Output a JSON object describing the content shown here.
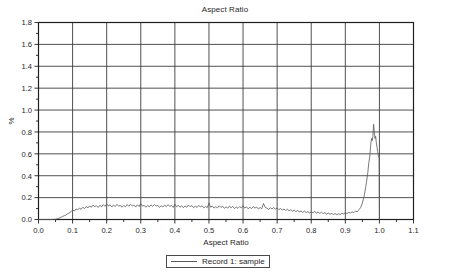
{
  "chart_data": {
    "type": "line",
    "title": "Aspect Ratio",
    "xlabel": "Aspect Ratio",
    "ylabel": "%",
    "xlim": [
      0.0,
      1.1
    ],
    "ylim": [
      0.0,
      1.8
    ],
    "grid": true,
    "legend_position": "bottom-center",
    "x_ticks": [
      "0.0",
      "0.1",
      "0.2",
      "0.3",
      "0.4",
      "0.5",
      "0.6",
      "0.7",
      "0.8",
      "0.9",
      "1.0",
      "1.1"
    ],
    "x_tick_values": [
      0.0,
      0.1,
      0.2,
      0.3,
      0.4,
      0.5,
      0.6,
      0.7,
      0.8,
      0.9,
      1.0,
      1.1
    ],
    "y_ticks": [
      "0.0",
      "0.2",
      "0.4",
      "0.6",
      "0.8",
      "1.0",
      "1.2",
      "1.4",
      "1.6",
      "1.8"
    ],
    "y_tick_values": [
      0.0,
      0.2,
      0.4,
      0.6,
      0.8,
      1.0,
      1.2,
      1.4,
      1.6,
      1.8
    ],
    "x_minor_step": 0.05,
    "y_minor_step": 0.1,
    "series": [
      {
        "name": "Record 1: sample",
        "color": "#595959",
        "x": [
          0.0,
          0.01,
          0.02,
          0.03,
          0.04,
          0.05,
          0.055,
          0.06,
          0.065,
          0.07,
          0.075,
          0.08,
          0.085,
          0.09,
          0.095,
          0.1,
          0.105,
          0.11,
          0.115,
          0.12,
          0.125,
          0.13,
          0.135,
          0.14,
          0.145,
          0.15,
          0.155,
          0.16,
          0.165,
          0.17,
          0.175,
          0.18,
          0.185,
          0.19,
          0.195,
          0.2,
          0.205,
          0.21,
          0.215,
          0.22,
          0.225,
          0.23,
          0.235,
          0.24,
          0.245,
          0.25,
          0.255,
          0.26,
          0.265,
          0.27,
          0.275,
          0.28,
          0.285,
          0.29,
          0.295,
          0.3,
          0.305,
          0.31,
          0.315,
          0.32,
          0.325,
          0.33,
          0.335,
          0.34,
          0.345,
          0.35,
          0.355,
          0.36,
          0.365,
          0.37,
          0.375,
          0.38,
          0.385,
          0.39,
          0.395,
          0.4,
          0.405,
          0.41,
          0.415,
          0.42,
          0.425,
          0.43,
          0.435,
          0.44,
          0.445,
          0.45,
          0.455,
          0.46,
          0.465,
          0.47,
          0.475,
          0.48,
          0.485,
          0.49,
          0.495,
          0.5,
          0.505,
          0.51,
          0.515,
          0.52,
          0.525,
          0.53,
          0.535,
          0.54,
          0.545,
          0.55,
          0.555,
          0.56,
          0.565,
          0.57,
          0.575,
          0.58,
          0.585,
          0.59,
          0.595,
          0.6,
          0.605,
          0.61,
          0.615,
          0.62,
          0.625,
          0.63,
          0.635,
          0.64,
          0.645,
          0.65,
          0.655,
          0.66,
          0.665,
          0.67,
          0.675,
          0.68,
          0.685,
          0.69,
          0.695,
          0.7,
          0.705,
          0.71,
          0.715,
          0.72,
          0.725,
          0.73,
          0.735,
          0.74,
          0.745,
          0.75,
          0.755,
          0.76,
          0.765,
          0.77,
          0.775,
          0.78,
          0.785,
          0.79,
          0.795,
          0.8,
          0.805,
          0.81,
          0.815,
          0.82,
          0.825,
          0.83,
          0.835,
          0.84,
          0.845,
          0.85,
          0.855,
          0.86,
          0.865,
          0.87,
          0.875,
          0.88,
          0.885,
          0.89,
          0.895,
          0.9,
          0.905,
          0.91,
          0.915,
          0.92,
          0.925,
          0.93,
          0.935,
          0.94,
          0.945,
          0.95,
          0.955,
          0.96,
          0.963,
          0.966,
          0.969,
          0.972,
          0.975,
          0.977,
          0.979,
          0.981,
          0.983,
          0.985,
          0.987,
          0.989,
          0.991,
          0.993,
          0.995,
          0.997,
          0.999,
          1.0
        ],
        "y": [
          0.0,
          0.0,
          0.0,
          0.0,
          0.0,
          0.002,
          0.006,
          0.012,
          0.018,
          0.026,
          0.034,
          0.04,
          0.052,
          0.06,
          0.07,
          0.086,
          0.078,
          0.096,
          0.088,
          0.104,
          0.094,
          0.112,
          0.1,
          0.118,
          0.106,
          0.124,
          0.112,
          0.132,
          0.118,
          0.126,
          0.11,
          0.13,
          0.116,
          0.136,
          0.12,
          0.142,
          0.124,
          0.134,
          0.114,
          0.132,
          0.118,
          0.138,
          0.122,
          0.13,
          0.112,
          0.128,
          0.116,
          0.136,
          0.12,
          0.14,
          0.124,
          0.132,
          0.114,
          0.134,
          0.118,
          0.146,
          0.122,
          0.13,
          0.112,
          0.128,
          0.116,
          0.134,
          0.12,
          0.138,
          0.122,
          0.13,
          0.11,
          0.126,
          0.114,
          0.132,
          0.118,
          0.136,
          0.12,
          0.128,
          0.11,
          0.14,
          0.116,
          0.13,
          0.112,
          0.126,
          0.108,
          0.124,
          0.112,
          0.132,
          0.116,
          0.128,
          0.108,
          0.122,
          0.11,
          0.13,
          0.114,
          0.126,
          0.106,
          0.12,
          0.108,
          0.15,
          0.112,
          0.124,
          0.104,
          0.118,
          0.106,
          0.126,
          0.11,
          0.122,
          0.102,
          0.116,
          0.104,
          0.122,
          0.108,
          0.12,
          0.1,
          0.114,
          0.102,
          0.118,
          0.106,
          0.126,
          0.104,
          0.116,
          0.098,
          0.112,
          0.1,
          0.118,
          0.104,
          0.114,
          0.096,
          0.11,
          0.098,
          0.146,
          0.112,
          0.104,
          0.092,
          0.108,
          0.096,
          0.11,
          0.094,
          0.106,
          0.09,
          0.1,
          0.086,
          0.096,
          0.082,
          0.094,
          0.08,
          0.09,
          0.076,
          0.086,
          0.072,
          0.082,
          0.07,
          0.078,
          0.066,
          0.076,
          0.064,
          0.072,
          0.06,
          0.07,
          0.062,
          0.074,
          0.06,
          0.068,
          0.056,
          0.066,
          0.054,
          0.062,
          0.05,
          0.058,
          0.048,
          0.056,
          0.046,
          0.054,
          0.044,
          0.052,
          0.046,
          0.058,
          0.05,
          0.062,
          0.054,
          0.066,
          0.058,
          0.07,
          0.062,
          0.078,
          0.07,
          0.09,
          0.11,
          0.15,
          0.21,
          0.3,
          0.36,
          0.43,
          0.52,
          0.58,
          0.7,
          0.74,
          0.72,
          0.76,
          0.87,
          0.8,
          0.74,
          0.76,
          0.7,
          0.66,
          0.62,
          0.58,
          0.56,
          0.0
        ]
      }
    ]
  },
  "legend": {
    "entries": [
      {
        "label": "Record 1: sample",
        "color": "#595959"
      }
    ]
  }
}
